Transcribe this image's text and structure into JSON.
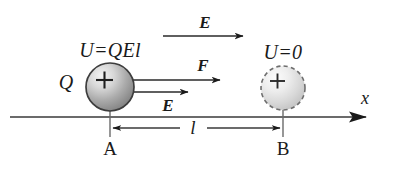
{
  "figure": {
    "background_color": "#ffffff",
    "ink_color": "#1a1a1a",
    "axis": {
      "name": "x-axis",
      "label": "x",
      "y": 117,
      "x_start": 10,
      "x_end": 372,
      "arrowhead": "solid-triangle",
      "label_x": 365,
      "label_y": 98
    },
    "charges": [
      {
        "id": "charge-a",
        "sign": "+",
        "charge_label": "Q",
        "potential_energy_label": "U = QEl",
        "potential_energy_text": "U=QEl",
        "position_label": "A",
        "outline": "solid",
        "cx": 110,
        "cy": 87,
        "r": 24,
        "fill_light": "#f2f2f2",
        "fill_dark": "#8e8e8e",
        "stroke": "#3d3d3d"
      },
      {
        "id": "charge-b",
        "sign": "+",
        "charge_label": "",
        "potential_energy_label": "U = 0",
        "potential_energy_text": "U=0",
        "position_label": "B",
        "outline": "dashed",
        "cx": 283,
        "cy": 88,
        "r": 22,
        "fill_light": "#fafafa",
        "fill_dark": "#c9c9c9",
        "stroke": "#6e6e6e"
      }
    ],
    "vectors": [
      {
        "id": "field-top",
        "label": "E",
        "kind": "electric-field",
        "x1": 163,
        "x2": 245,
        "y": 36,
        "label_x": 205,
        "label_y": 22
      },
      {
        "id": "force",
        "label": "F",
        "kind": "force",
        "x1": 112,
        "x2": 222,
        "y": 80,
        "label_x": 203,
        "label_y": 65
      },
      {
        "id": "field-at-charge",
        "label": "E",
        "kind": "electric-field",
        "x1": 112,
        "x2": 190,
        "y": 92,
        "label_x": 168,
        "label_y": 105
      }
    ],
    "dimension": {
      "id": "separation",
      "label": "l",
      "y": 128,
      "x_start": 110,
      "x_end": 283,
      "gap_left": 182,
      "gap_right": 205,
      "label_x": 193,
      "label_y": 127,
      "tick_top": 110,
      "tick_bottom": 137
    },
    "point_labels": [
      {
        "id": "point-a",
        "text": "A",
        "x": 110,
        "y": 148
      },
      {
        "id": "point-b",
        "text": "B",
        "x": 283,
        "y": 148
      }
    ],
    "energy_labels": [
      {
        "id": "energy-a",
        "text": "U=QEl",
        "x": 110,
        "y": 50
      },
      {
        "id": "energy-b",
        "text": "U=0",
        "x": 283,
        "y": 52
      }
    ],
    "charge_symbol_labels": [
      {
        "id": "charge-symbol-q",
        "text": "Q",
        "x": 66,
        "y": 82
      }
    ],
    "plus_signs": [
      {
        "id": "plus-a",
        "text": "+",
        "x": 104,
        "y": 80
      },
      {
        "id": "plus-b",
        "text": "+",
        "x": 277,
        "y": 81
      }
    ]
  }
}
